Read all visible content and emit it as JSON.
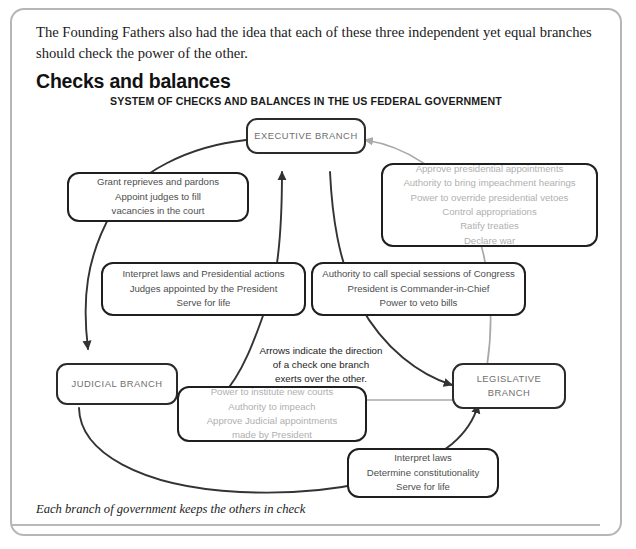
{
  "page": {
    "intro_paragraph": "The Founding Fathers also had the idea that each of these three independent yet equal branches should check the power of the other.",
    "heading": "Checks and balances",
    "diagram_title": "SYSTEM OF CHECKS AND BALANCES IN THE US FEDERAL GOVERNMENT",
    "caption": "Each branch of government keeps the others in check"
  },
  "colors": {
    "frame_border": "#b6b6b6",
    "node_border": "#2b2b2b",
    "node_label": "#6f6f6f",
    "detail_dark_text": "#4e4e4e",
    "detail_light_text": "#b0b0b0",
    "arrow_dark": "#333333",
    "arrow_light": "#a9a9a9",
    "rule": "#b9b9b9",
    "page_background": "#ffffff"
  },
  "diagram": {
    "type": "cycle-diagram",
    "nodes": [
      {
        "id": "executive",
        "label": "EXECUTIVE BRANCH"
      },
      {
        "id": "judicial",
        "label": "JUDICIAL BRANCH"
      },
      {
        "id": "legislative",
        "label": "LEGISLATIVE\nBRANCH"
      }
    ],
    "boxes": [
      {
        "id": "executive-over-judicial",
        "tone": "dark",
        "lines": [
          "Grant reprieves and pardons",
          "Appoint judges to fill",
          "vacancies in the court"
        ]
      },
      {
        "id": "legislative-over-executive",
        "tone": "light",
        "lines": [
          "Approve presidential appointments",
          "Authority to bring impeachment hearings",
          "Power to override presidential vetoes",
          "Control appropriations",
          "Ratify treaties",
          "Declare war"
        ]
      },
      {
        "id": "judicial-over-executive",
        "tone": "dark",
        "lines": [
          "Interpret laws and Presidential actions",
          "Judges appointed by the President",
          "Serve for life"
        ]
      },
      {
        "id": "executive-over-legislative",
        "tone": "dark",
        "lines": [
          "Authority to call special sessions of Congress",
          "President is Commander-in-Chief",
          "Power to veto bills"
        ]
      },
      {
        "id": "legislative-over-judicial",
        "tone": "light",
        "lines": [
          "Power to institute new courts",
          "Authority to impeach",
          "Approve Judicial appointments",
          "made by President"
        ]
      },
      {
        "id": "judicial-over-legislative",
        "tone": "dark",
        "lines": [
          "Interpret laws",
          "Determine constitutionality",
          "Serve for life"
        ]
      }
    ],
    "annotation": {
      "id": "arrow-legend",
      "lines": [
        "Arrows indicate the direction",
        "of a check one branch",
        "exerts over the other."
      ]
    },
    "arrows": [
      {
        "id": "executive-to-judicial",
        "from": "executive",
        "to": "judicial",
        "tone": "dark"
      },
      {
        "id": "judicial-to-executive",
        "from": "judicial",
        "to": "executive",
        "tone": "dark"
      },
      {
        "id": "legislative-to-executive",
        "from": "legislative",
        "to": "executive",
        "tone": "light"
      },
      {
        "id": "executive-to-legislative",
        "from": "executive",
        "to": "legislative",
        "tone": "dark"
      },
      {
        "id": "legislative-to-judicial",
        "from": "legislative",
        "to": "judicial",
        "tone": "light"
      },
      {
        "id": "judicial-to-legislative",
        "from": "judicial",
        "to": "legislative",
        "tone": "dark"
      }
    ]
  }
}
